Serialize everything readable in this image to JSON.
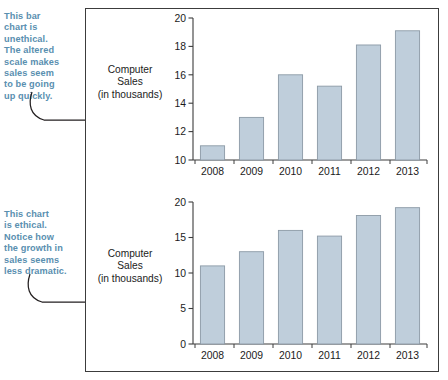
{
  "figure": {
    "bar_fill": "#bfcedb",
    "bar_stroke": "#8c9aa6",
    "axis_color": "#3c3c3c",
    "annotation_color": "#5a8fb0",
    "frame_color": "#3c3c3c",
    "caption_text": "Computer\nSales\n(in thousands)"
  },
  "annotations": {
    "top": "This bar\nchart is\nunethical.\nThe altered\nscale makes\nsales seem\nto be going\nup quickly.",
    "bottom": "This chart\nis ethical.\nNotice how\nthe growth in\nsales seems\nless dramatic."
  },
  "chart_data": [
    {
      "type": "bar",
      "id": "unethical-truncated-axis",
      "title": "",
      "xlabel": "",
      "ylabel": "Computer Sales (in thousands)",
      "categories": [
        "2008",
        "2009",
        "2010",
        "2011",
        "2012",
        "2013"
      ],
      "values": [
        11.0,
        13.0,
        16.0,
        15.2,
        18.1,
        19.1
      ],
      "ylim": [
        10,
        20
      ],
      "yticks": [
        10,
        12,
        14,
        16,
        18,
        20
      ],
      "yticklabels": [
        "10",
        "12",
        "14",
        "16",
        "18",
        "20"
      ],
      "grid": false,
      "legend": "none",
      "note": "y-axis truncated at 10 — exaggerates growth"
    },
    {
      "type": "bar",
      "id": "ethical-full-axis",
      "title": "",
      "xlabel": "",
      "ylabel": "Computer Sales (in thousands)",
      "categories": [
        "2008",
        "2009",
        "2010",
        "2011",
        "2012",
        "2013"
      ],
      "values": [
        11.0,
        13.0,
        16.0,
        15.2,
        18.1,
        19.2
      ],
      "ylim": [
        0,
        20
      ],
      "yticks": [
        0,
        5,
        10,
        15,
        20
      ],
      "yticklabels": [
        "0",
        "5",
        "10",
        "15",
        "20"
      ],
      "grid": false,
      "legend": "none",
      "note": "y-axis starts at 0 — growth appears less dramatic"
    }
  ]
}
